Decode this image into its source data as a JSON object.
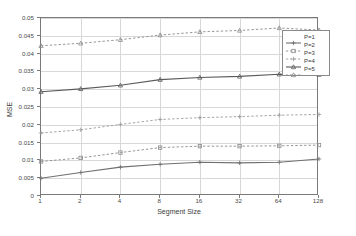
{
  "chart_data": {
    "type": "line",
    "title": "",
    "xlabel": "Segment Size",
    "ylabel": "MSE",
    "x": [
      1,
      2,
      4,
      8,
      16,
      32,
      64,
      128
    ],
    "xtick_labels": [
      "1",
      "2",
      "4",
      "8",
      "16",
      "32",
      "64",
      "128"
    ],
    "xscale": "log2",
    "ytick_labels": [
      "0",
      "0.005",
      "0.01",
      "0.015",
      "0.02",
      "0.025",
      "0.03",
      "0.035",
      "0.04",
      "0.045",
      "0.05"
    ],
    "ytick_values": [
      0,
      0.005,
      0.01,
      0.015,
      0.02,
      0.025,
      0.03,
      0.035,
      0.04,
      0.045,
      0.05
    ],
    "ylim": [
      0,
      0.05
    ],
    "grid": true,
    "legend_position": "upper right",
    "series": [
      {
        "name": "P=1",
        "values": [
          0.005,
          0.0066,
          0.0081,
          0.0089,
          0.0095,
          0.0093,
          0.0095,
          0.0104
        ],
        "style": "solid",
        "color": "#6f6f6f",
        "marker": "plus"
      },
      {
        "name": "P=2",
        "values": [
          0.0097,
          0.0107,
          0.0122,
          0.0136,
          0.014,
          0.014,
          0.0141,
          0.0143
        ],
        "style": "dashed",
        "color": "#8a8a8a",
        "marker": "square"
      },
      {
        "name": "P=3",
        "values": [
          0.0177,
          0.0186,
          0.0201,
          0.0215,
          0.022,
          0.0223,
          0.0227,
          0.0229
        ],
        "style": "dashed",
        "color": "#9a9a9a",
        "marker": "plus"
      },
      {
        "name": "P=4",
        "values": [
          0.0293,
          0.0301,
          0.0311,
          0.0327,
          0.0333,
          0.0336,
          0.0342,
          0.0341
        ],
        "style": "solid",
        "color": "#5a5a5a",
        "marker": "triangle"
      },
      {
        "name": "P=5",
        "values": [
          0.0422,
          0.0429,
          0.0439,
          0.0452,
          0.0461,
          0.0465,
          0.0472,
          0.0466
        ],
        "style": "dashed",
        "color": "#8a8a8a",
        "marker": "triangle"
      }
    ]
  }
}
